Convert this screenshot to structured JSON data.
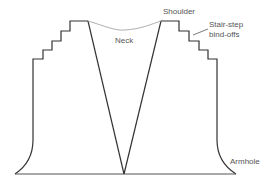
{
  "diagram": {
    "type": "knitting-schematic",
    "labels": {
      "neck": "Neck",
      "shoulder": "Shoulder",
      "stair_step_line1": "Stair-step",
      "stair_step_line2": "bind-offs",
      "armhole": "Armhole"
    },
    "colors": {
      "outline": "#333333",
      "neck_curve": "#999999",
      "label": "#555555",
      "baseline": "#777777"
    }
  }
}
